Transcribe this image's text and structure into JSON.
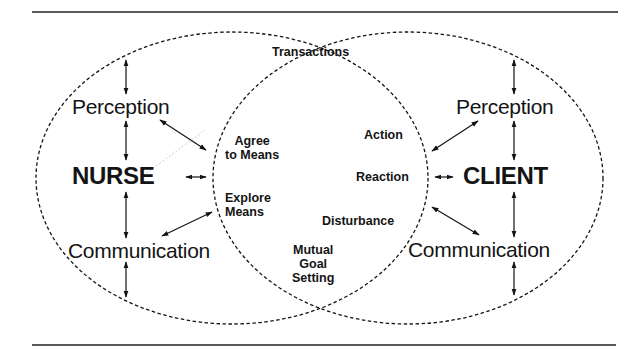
{
  "diagram": {
    "type": "venn-two-ellipses",
    "colors": {
      "ink": "#141414",
      "background": "#ffffff"
    },
    "nurse_system": {
      "label": "NURSE",
      "upper": "Perception",
      "lower": "Communication"
    },
    "client_system": {
      "label": "CLIENT",
      "upper": "Perception",
      "lower": "Communication"
    },
    "overlap": {
      "title": "Transactions",
      "left_items": [
        "Agree to Means",
        "Explore Means"
      ],
      "left_lines": {
        "agree_1": "Agree",
        "agree_2": "to Means",
        "explore_1": "Explore",
        "explore_2": "Means"
      },
      "right_items": [
        "Action",
        "Reaction",
        "Disturbance"
      ],
      "bottom": {
        "line1": "Mutual",
        "line2": "Goal",
        "line3": "Setting"
      }
    }
  }
}
